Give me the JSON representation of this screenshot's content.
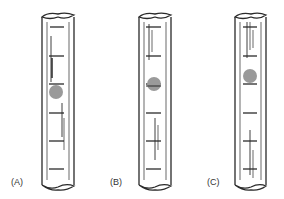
{
  "figure": {
    "ink_color": "#2a2a2a",
    "sphere_color": "#9a9a9a",
    "panels": [
      {
        "label": "(A)",
        "sphere_position": "below middle, at a graduation mark"
      },
      {
        "label": "(B)",
        "sphere_position": "middle, centered on a graduation mark"
      },
      {
        "label": "(C)",
        "sphere_position": "upper-middle, resting above a graduation mark"
      }
    ]
  }
}
